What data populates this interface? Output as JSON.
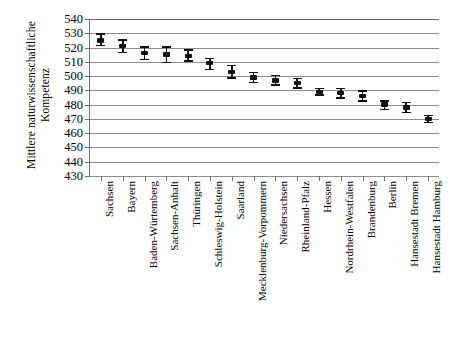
{
  "chart_data": {
    "type": "scatter",
    "title": "",
    "xlabel": "",
    "ylabel": "Mittlere naturwissenschaftliche Kompetenz",
    "ylabel_lines": [
      "Mittlere naturwissenschaftliche",
      "Kompetenz"
    ],
    "ylim": [
      430,
      540
    ],
    "ytick_step": 10,
    "yticks": [
      540,
      530,
      520,
      510,
      500,
      490,
      480,
      470,
      460,
      450,
      440,
      430
    ],
    "grid": true,
    "legend": "none",
    "error_bars": "95%-Konfidenzintervall",
    "categories": [
      "Sachsen",
      "Bayern",
      "Baden-Würtemberg",
      "Sachsen-Anhalt",
      "Thüringen",
      "Schleswig-Holstein",
      "Saarland",
      "Mecklenburg-Vorpommern",
      "Niedersachsen",
      "Rheinland-Pfalz",
      "Hessen",
      "Nordrhein-Westfalen",
      "Brandenburg",
      "Berlin",
      "Hansestadt Bremen",
      "Hansestadt Hamburg"
    ],
    "values": [
      525,
      521,
      516,
      515,
      514,
      509,
      503,
      499,
      497,
      495,
      489,
      488,
      486,
      480,
      478,
      470
    ],
    "ci_low": [
      521,
      516,
      511,
      509,
      510,
      504,
      498,
      495,
      493,
      491,
      486,
      484,
      482,
      476,
      474,
      467
    ],
    "ci_high": [
      530,
      526,
      521,
      521,
      519,
      513,
      508,
      503,
      501,
      499,
      492,
      492,
      490,
      483,
      482,
      473
    ]
  }
}
